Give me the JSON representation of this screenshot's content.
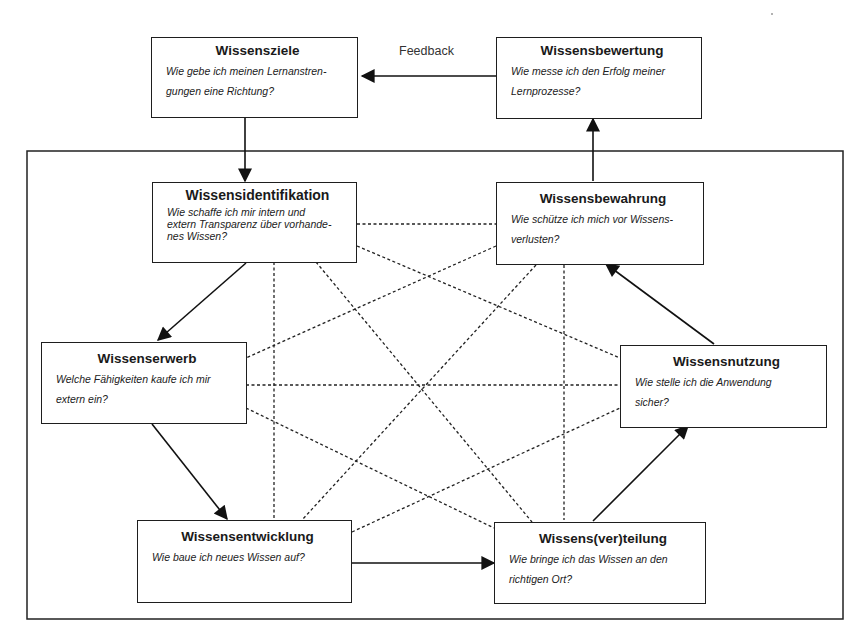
{
  "diagram": {
    "feedback_label": "Feedback",
    "boxes": {
      "wissensziele": {
        "title": "Wissensziele",
        "question": "Wie gebe ich meinen Lernanstren-gungen eine Richtung?",
        "lines": [
          "Wie gebe ich meinen Lernanstren-",
          "gungen eine Richtung?"
        ]
      },
      "wissensbewertung": {
        "title": "Wissensbewertung",
        "lines": [
          "Wie messe ich den Erfolg meiner",
          "Lernprozesse?"
        ]
      },
      "wissensidentifikation": {
        "title": "Wissensidentifikation",
        "lines": [
          "Wie schaffe ich mir intern und",
          "extern Transparenz über vorhande-",
          "nes Wissen?"
        ]
      },
      "wissensbewahrung": {
        "title": "Wissensbewahrung",
        "lines": [
          "Wie schütze ich mich vor Wissens-",
          "verlusten?"
        ]
      },
      "wissenserwerb": {
        "title": "Wissenserwerb",
        "lines": [
          "Welche Fähigkeiten kaufe ich mir",
          "extern ein?"
        ]
      },
      "wissensnutzung": {
        "title": "Wissensnutzung",
        "lines": [
          "Wie stelle ich die Anwendung",
          "sicher?"
        ]
      },
      "wissensentwicklung": {
        "title": "Wissensentwicklung",
        "lines": [
          "Wie baue ich neues Wissen auf?"
        ]
      },
      "wissensverteilung": {
        "title": "Wissens(ver)teilung",
        "lines": [
          "Wie bringe ich das Wissen an den",
          "richtigen Ort?"
        ]
      }
    },
    "arrows": [
      {
        "from": "Wissensbewertung",
        "to": "Wissensziele",
        "label": "Feedback"
      },
      {
        "from": "Wissensziele",
        "to": "Wissensidentifikation"
      },
      {
        "from": "Wissensidentifikation",
        "to": "Wissenserwerb"
      },
      {
        "from": "Wissenserwerb",
        "to": "Wissensentwicklung"
      },
      {
        "from": "Wissensentwicklung",
        "to": "Wissens(ver)teilung"
      },
      {
        "from": "Wissens(ver)teilung",
        "to": "Wissensnutzung"
      },
      {
        "from": "Wissensnutzung",
        "to": "Wissensbewahrung"
      },
      {
        "from": "Wissensbewahrung",
        "to": "Wissensbewertung"
      }
    ],
    "colors": {
      "stroke": "#1e1e1e",
      "background": "#ffffff"
    }
  }
}
